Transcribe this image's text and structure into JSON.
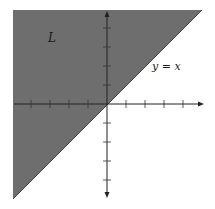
{
  "diagram": {
    "region_label": "L",
    "line_label": "y = x",
    "region_color": "#6e6e6e",
    "line_color": "#222222",
    "axis_color": "#222222",
    "origin_px": [
      107,
      104
    ],
    "tick_spacing_px": 19,
    "x_ticks_count_each_side": 4,
    "y_ticks_count_each_side": 4
  }
}
